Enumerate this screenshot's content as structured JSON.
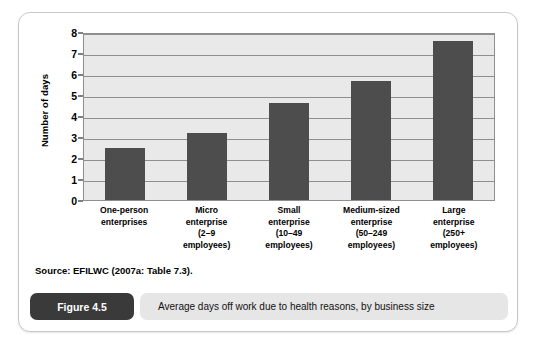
{
  "figure": {
    "badge_label": "Figure 4.5",
    "caption": "Average days off work due to health reasons, by business size",
    "source": "Source: EFILWC (2007a: Table 7.3)."
  },
  "chart_data": {
    "type": "bar",
    "title": "",
    "xlabel": "",
    "ylabel": "Number of days",
    "ylim": [
      0,
      8
    ],
    "yticks": [
      0,
      1,
      2,
      3,
      4,
      5,
      6,
      7,
      8
    ],
    "grid": true,
    "legend": "none",
    "bar_color": "#4d4d4d",
    "plot_background": "#e9e9e9",
    "categories": [
      "One-person enterprises",
      "Micro enterprise (2–9 employees)",
      "Small enterprise (10–49 employees)",
      "Medium-sized enterprise (50–249 employees)",
      "Large enterprise (250+ employees)"
    ],
    "category_lines": [
      [
        "One-person",
        "enterprises"
      ],
      [
        "Micro",
        "enterprise",
        "(2–9",
        "employees)"
      ],
      [
        "Small",
        "enterprise",
        "(10–49",
        "employees)"
      ],
      [
        "Medium-sized",
        "enterprise",
        "(50–249",
        "employees)"
      ],
      [
        "Large",
        "enterprise",
        "(250+",
        "employees)"
      ]
    ],
    "values": [
      2.5,
      3.2,
      4.6,
      5.65,
      7.55
    ]
  }
}
